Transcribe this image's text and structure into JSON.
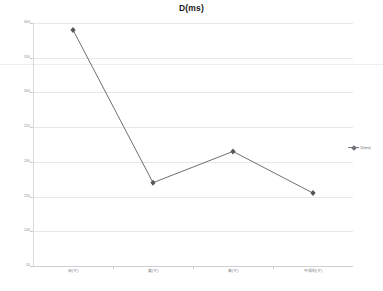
{
  "chart": {
    "title": "D(ms)",
    "legend_label": "D(ms)",
    "legend_position": "right"
  },
  "chart_data": {
    "type": "line",
    "title": "D(ms)",
    "xlabel": "",
    "ylabel": "",
    "categories": [
      "赤(マ)",
      "黄(マ)",
      "青(マ)",
      "不規則(マ)"
    ],
    "series": [
      {
        "name": "D(ms)",
        "values": [
          390,
          170,
          215,
          155
        ]
      }
    ],
    "yticks": [
      50,
      100,
      150,
      200,
      250,
      300,
      350,
      400
    ],
    "ylim": [
      50,
      400
    ],
    "grid": true,
    "legend": "right",
    "marker": "diamond",
    "line_color": "#6f6f75"
  },
  "yaxis": {
    "ticks": [
      "400",
      "350",
      "300",
      "250",
      "200",
      "150",
      "100",
      "50"
    ]
  },
  "xaxis": {
    "ticks": [
      "赤(マ)",
      "黄(マ)",
      "青(マ)",
      "不規則(マ)"
    ]
  },
  "colors": {
    "line": "#6f6f75",
    "grid": "#e8e8ec",
    "axis": "#d0d0d4",
    "text": "#7d7d83",
    "title": "#1a1a1a"
  }
}
